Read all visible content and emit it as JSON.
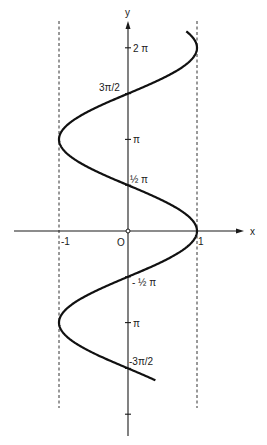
{
  "chart_data": {
    "type": "line",
    "title": "",
    "equation": "x = cos(y)",
    "xlabel": "x",
    "ylabel": "y",
    "origin_label": "O",
    "xlim": [
      -1.65,
      1.7
    ],
    "ylim": [
      -2.1,
      2.25
    ],
    "ylim_units": "multiples of pi",
    "x_ticks": [
      {
        "value": -1,
        "label": "-1"
      },
      {
        "value": 1,
        "label": "1"
      }
    ],
    "y_ticks": [
      {
        "value": 2.0,
        "label": "2 π"
      },
      {
        "value": 1.5,
        "label": "3π/2"
      },
      {
        "value": 1.0,
        "label": "π"
      },
      {
        "value": 0.5,
        "label": "½ π"
      },
      {
        "value": -0.5,
        "label": "- ½ π"
      },
      {
        "value": -1.0,
        "label": "π"
      },
      {
        "value": -1.5,
        "label": "-3π/2"
      },
      {
        "value": -2.0,
        "label": ""
      }
    ],
    "asymptotes_dashed": [
      -1,
      1
    ],
    "series": [
      {
        "name": "x = cos y",
        "y_range_pi": [
          -1.63,
          2.18
        ]
      }
    ],
    "grid": false,
    "legend": "none"
  }
}
